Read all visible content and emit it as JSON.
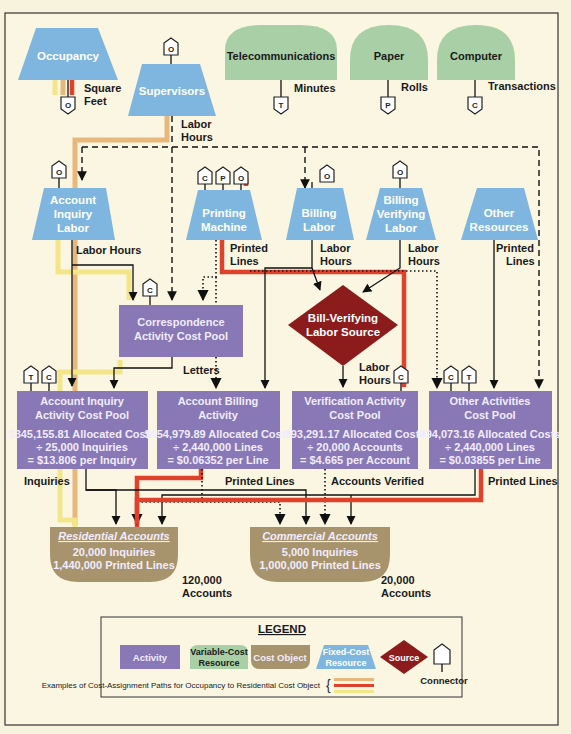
{
  "resources": {
    "occupancy": {
      "label": "Occupancy",
      "driver": [
        "Square",
        "Feet"
      ],
      "connector": "O"
    },
    "supervisors": {
      "label": "Supervisors",
      "driver": [
        "Labor",
        "Hours"
      ],
      "connector": "O"
    },
    "telecommunications": {
      "label": "Telecommunications",
      "driver": "Minutes",
      "connector": "T"
    },
    "paper": {
      "label": "Paper",
      "driver": "Rolls",
      "connector": "P"
    },
    "computer": {
      "label": "Computer",
      "driver": "Transactions",
      "connector": "C"
    },
    "account_inquiry_labor": {
      "label": [
        "Account",
        "Inquiry",
        "Labor"
      ],
      "driver": "Labor Hours",
      "connector": "O"
    },
    "printing_machine": {
      "label": [
        "Printing",
        "Machine"
      ],
      "driver": [
        "Printed",
        "Lines"
      ],
      "connectors": [
        "C",
        "P",
        "O"
      ]
    },
    "billing_labor": {
      "label": [
        "Billing",
        "Labor"
      ],
      "driver": [
        "Labor",
        "Hours"
      ],
      "connector": "O"
    },
    "billing_verifying_labor": {
      "label": [
        "Billing",
        "Verifying",
        "Labor"
      ],
      "driver": [
        "Labor",
        "Hours"
      ],
      "connector": "O"
    },
    "other_resources": {
      "label": [
        "Other",
        "Resources"
      ],
      "driver": [
        "Printed",
        "Lines"
      ]
    }
  },
  "source": {
    "label": [
      "Bill-Verifying",
      "Labor Source"
    ],
    "driver": [
      "Labor",
      "Hours"
    ]
  },
  "activities": {
    "correspondence": {
      "label": [
        "Correspondence",
        "Activity Cost Pool"
      ],
      "driver": "Letters",
      "connector": "C"
    },
    "account_inquiry": {
      "label": [
        "Account Inquiry",
        "Activity Cost Pool"
      ],
      "lines": [
        "$345,155.81 Allocated Costs",
        "÷ 25,000 Inquiries",
        "= $13.806 per Inquiry"
      ],
      "driver": "Inquiries",
      "connectors": [
        "T",
        "C"
      ]
    },
    "account_billing": {
      "label": [
        "Account Billing",
        "Activity"
      ],
      "lines": [
        "$154,979.89 Allocated Costs",
        "÷ 2,440,000 Lines",
        "= $0.06352 per Line"
      ],
      "driver": "Printed Lines"
    },
    "verification": {
      "label": [
        "Verification Activity",
        "Cost Pool"
      ],
      "lines": [
        "$93,291.17 Allocated Costs",
        "÷ 20,000 Accounts",
        "= $4.665 per Account"
      ],
      "driver": "Accounts Verified",
      "connector": "C"
    },
    "other": {
      "label": [
        "Other Activities",
        "Cost Pool"
      ],
      "lines": [
        "$94,073.16 Allocated Costs",
        "÷ 2,440,000 Lines",
        "= $0.03855 per Line"
      ],
      "driver": "Printed Lines",
      "connectors": [
        "C",
        "T"
      ]
    }
  },
  "cost_objects": {
    "residential": {
      "title": "Residential Accounts",
      "lines": [
        "20,000 Inquiries",
        "1,440,000 Printed Lines"
      ],
      "count": [
        "120,000",
        "Accounts"
      ]
    },
    "commercial": {
      "title": "Commercial Accounts",
      "lines": [
        "5,000 Inquiries",
        "1,000,000 Printed Lines"
      ],
      "count": [
        "20,000",
        "Accounts"
      ]
    }
  },
  "legend": {
    "title": "LEGEND",
    "activity": "Activity",
    "variable": [
      "Variable-Cost",
      "Resource"
    ],
    "cost_object": "Cost Object",
    "fixed": [
      "Fixed-Cost",
      "Resource"
    ],
    "source": "Source",
    "connector": "Connector",
    "paths_note": "Examples of Cost-Assignment Paths for Occupancy to Residential Cost Object",
    "path_colors": [
      "#e8b77b",
      "#e0412b",
      "#f3e58a"
    ]
  },
  "colors": {
    "fixed_resource": "#7fb6e0",
    "variable_resource": "#a9cfa6",
    "activity": "#8878b5",
    "cost_object": "#a8946c",
    "source": "#8c1c1c",
    "background": "#f7f3dc"
  }
}
